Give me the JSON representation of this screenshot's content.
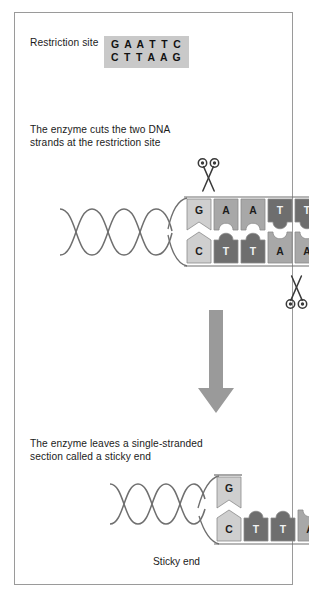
{
  "figure": {
    "border_color": "#9a9a9a",
    "background": "#ffffff"
  },
  "palette": {
    "base_light": "#cfcfcf",
    "base_medium": "#a8a8a8",
    "base_dark": "#6e6e6e",
    "helix_line": "#6f6f6f",
    "arrow_fill": "#9a9a9a",
    "box_fill": "#c9c9c9",
    "text": "#1b1b1b"
  },
  "section_restriction_site": {
    "label": "Restriction site",
    "sequence_top": "G A A T T C",
    "sequence_bottom": "C T T A A G"
  },
  "section_cut": {
    "text": "The enzyme cuts the two DNA\nstrands at the restriction site",
    "scissors_top_name": "scissors-icon-top",
    "scissors_bottom_name": "scissors-icon-bottom",
    "top_strand": [
      {
        "base": "G",
        "shade": "#cfcfcf",
        "top_shape": "flat",
        "bottom_shape": "chevron-up"
      },
      {
        "base": "A",
        "shade": "#a8a8a8",
        "top_shape": "flat",
        "bottom_shape": "notch"
      },
      {
        "base": "A",
        "shade": "#a8a8a8",
        "top_shape": "flat",
        "bottom_shape": "notch"
      },
      {
        "base": "T",
        "shade": "#6e6e6e",
        "top_shape": "flat",
        "bottom_shape": "knob"
      },
      {
        "base": "T",
        "shade": "#6e6e6e",
        "top_shape": "flat",
        "bottom_shape": "knob"
      },
      {
        "base": "C",
        "shade": "#cfcfcf",
        "top_shape": "flat",
        "bottom_shape": "chevron-down"
      }
    ],
    "bottom_strand": [
      {
        "base": "C",
        "shade": "#cfcfcf",
        "top_shape": "chevron-up",
        "bottom_shape": "flat"
      },
      {
        "base": "T",
        "shade": "#6e6e6e",
        "top_shape": "knob",
        "bottom_shape": "flat"
      },
      {
        "base": "T",
        "shade": "#6e6e6e",
        "top_shape": "knob",
        "bottom_shape": "flat"
      },
      {
        "base": "A",
        "shade": "#a8a8a8",
        "top_shape": "notch",
        "bottom_shape": "flat"
      },
      {
        "base": "A",
        "shade": "#a8a8a8",
        "top_shape": "notch",
        "bottom_shape": "flat"
      },
      {
        "base": "G",
        "shade": "#cfcfcf",
        "top_shape": "chevron-down",
        "bottom_shape": "flat"
      }
    ]
  },
  "section_result": {
    "text": "The enzyme leaves a single-stranded\nsection called a sticky end",
    "caption": "Sticky end",
    "top_strand": [
      {
        "base": "G",
        "shade": "#cfcfcf",
        "top_shape": "flat",
        "bottom_shape": "chevron-up"
      }
    ],
    "bottom_strand": [
      {
        "base": "C",
        "shade": "#cfcfcf",
        "top_shape": "chevron-up",
        "bottom_shape": "flat"
      },
      {
        "base": "T",
        "shade": "#6e6e6e",
        "top_shape": "knob",
        "bottom_shape": "flat"
      },
      {
        "base": "T",
        "shade": "#6e6e6e",
        "top_shape": "knob",
        "bottom_shape": "flat"
      },
      {
        "base": "A",
        "shade": "#a8a8a8",
        "top_shape": "notch",
        "bottom_shape": "flat"
      },
      {
        "base": "A",
        "shade": "#a8a8a8",
        "top_shape": "notch",
        "bottom_shape": "flat"
      }
    ]
  },
  "arrow": {
    "direction": "down",
    "color": "#9a9a9a"
  }
}
